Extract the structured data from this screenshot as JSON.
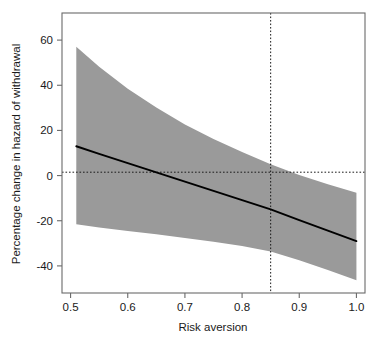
{
  "chart_data": {
    "type": "line",
    "title": "",
    "subtitle": "",
    "xlabel": "Risk aversion",
    "ylabel": "Percentage change in hazard of withdrawal",
    "xlim": [
      0.485,
      1.015
    ],
    "ylim": [
      -52,
      72
    ],
    "xticks": [
      0.5,
      0.6,
      0.7,
      0.8,
      0.9,
      1.0
    ],
    "xticklabels": [
      "0.5",
      "0.6",
      "0.7",
      "0.8",
      "0.9",
      "1.0"
    ],
    "yticks": [
      -40,
      -20,
      0,
      20,
      40,
      60
    ],
    "yticklabels": [
      "-40",
      "-20",
      "0",
      "20",
      "40",
      "60"
    ],
    "grid": false,
    "legend": null,
    "band_color": "#9a9a9a",
    "line_color": "#000000",
    "frame_color": "#555555",
    "x": [
      0.51,
      0.55,
      0.6,
      0.65,
      0.7,
      0.75,
      0.8,
      0.85,
      0.9,
      0.95,
      1.0
    ],
    "series": [
      {
        "name": "Estimate",
        "style": "solid",
        "values": [
          13.0,
          9.6,
          5.5,
          1.4,
          -2.7,
          -6.8,
          -10.9,
          -15.0,
          -19.7,
          -24.4,
          -29.0
        ]
      },
      {
        "name": "Upper 95% CI",
        "style": "band-upper",
        "values": [
          57.0,
          48.2,
          38.5,
          30.1,
          22.6,
          16.2,
          10.4,
          5.0,
          0.3,
          -3.8,
          -7.6
        ]
      },
      {
        "name": "Lower 95% CI",
        "style": "band-lower",
        "values": [
          -21.5,
          -23.0,
          -24.5,
          -26.0,
          -27.6,
          -29.3,
          -31.2,
          -33.6,
          -37.5,
          -41.8,
          -46.4
        ]
      }
    ],
    "reference_lines": [
      {
        "name": "zero-reference-horizontal",
        "orientation": "horizontal",
        "value": 1.5,
        "style": "dotted"
      },
      {
        "name": "threshold-vertical",
        "orientation": "vertical",
        "value": 0.85,
        "style": "dotted"
      }
    ],
    "annotations": []
  }
}
